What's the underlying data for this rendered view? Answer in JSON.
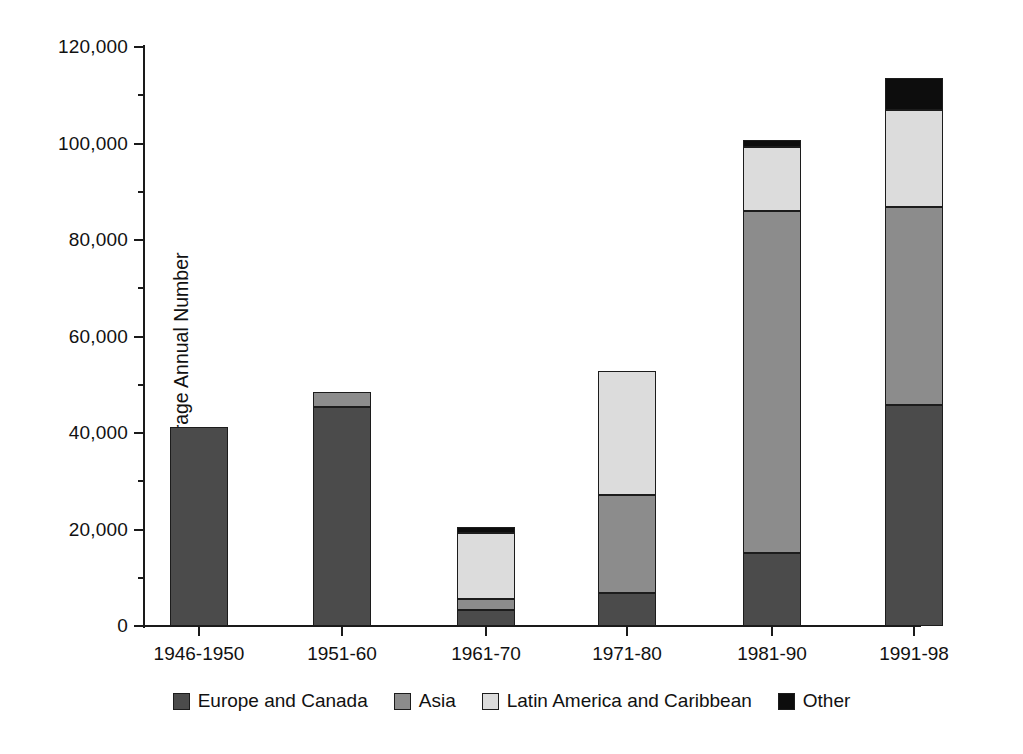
{
  "chart_data": {
    "type": "bar",
    "subtype": "stacked-vertical",
    "title": "",
    "xlabel": "",
    "ylabel": "Average Annual Number",
    "ylim": [
      0,
      120000
    ],
    "ytick_step": 20000,
    "yticks": [
      0,
      20000,
      40000,
      60000,
      80000,
      100000,
      120000
    ],
    "ytick_labels": [
      "0",
      "20,000",
      "40,000",
      "60,000",
      "80,000",
      "100,000",
      "120,000"
    ],
    "grid": false,
    "legend_position": "bottom-center",
    "categories": [
      "1946-1950",
      "1951-60",
      "1961-70",
      "1971-80",
      "1981-90",
      "1991-98"
    ],
    "series": [
      {
        "name": "Europe and Canada",
        "color": "#4b4b4b",
        "values": [
          41200,
          45400,
          3300,
          6800,
          15100,
          45800
        ]
      },
      {
        "name": "Asia",
        "color": "#8c8c8c",
        "values": [
          0,
          3100,
          2300,
          20400,
          70900,
          41000
        ]
      },
      {
        "name": "Latin America and Caribbean",
        "color": "#dcdcdc",
        "values": [
          0,
          0,
          13700,
          25600,
          13300,
          20100
        ]
      },
      {
        "name": "Other",
        "color": "#0d0d0d",
        "values": [
          0,
          0,
          1200,
          0,
          1500,
          6600
        ]
      }
    ],
    "totals": [
      41200,
      48500,
      20500,
      52800,
      100800,
      113500
    ]
  },
  "axes": {
    "y_title": "Average Annual Number",
    "y_tick_labels": [
      "120,000",
      "100,000",
      "80,000",
      "60,000",
      "40,000",
      "20,000",
      "0"
    ],
    "x_tick_labels": [
      "1946-1950",
      "1951-60",
      "1961-70",
      "1971-80",
      "1981-90",
      "1991-98"
    ]
  },
  "legend": {
    "items": [
      {
        "label": "Europe and Canada",
        "color": "#4b4b4b",
        "swatch_name": "legend-swatch-europe-and-canada"
      },
      {
        "label": "Asia",
        "color": "#8c8c8c",
        "swatch_name": "legend-swatch-asia"
      },
      {
        "label": "Latin America and Caribbean",
        "color": "#dcdcdc",
        "swatch_name": "legend-swatch-latin-america-and-caribbean"
      },
      {
        "label": "Other",
        "color": "#0d0d0d",
        "swatch_name": "legend-swatch-other"
      }
    ]
  }
}
